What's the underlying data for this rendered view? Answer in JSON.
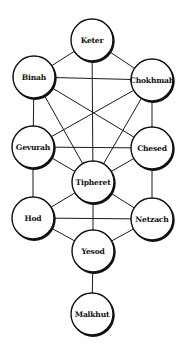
{
  "diagram": {
    "colors": {
      "background": "#ffffff",
      "line": "#1a1a1a",
      "node_fill": "#ffffff",
      "node_stroke": "#111111",
      "text": "#111111"
    },
    "node_radius": 21,
    "nodes": [
      {
        "id": "keter",
        "label": "Keter",
        "x": 92,
        "y": 40
      },
      {
        "id": "binah",
        "label": "Binah",
        "x": 34,
        "y": 77
      },
      {
        "id": "chokhmah",
        "label": "Chokhmah",
        "x": 152,
        "y": 80
      },
      {
        "id": "gevurah",
        "label": "Gevurah",
        "x": 33,
        "y": 147
      },
      {
        "id": "chesed",
        "label": "Chesed",
        "x": 152,
        "y": 148
      },
      {
        "id": "tipheret",
        "label": "Tipheret",
        "x": 93,
        "y": 182
      },
      {
        "id": "hod",
        "label": "Hod",
        "x": 33,
        "y": 218
      },
      {
        "id": "netzach",
        "label": "Netzach",
        "x": 152,
        "y": 219
      },
      {
        "id": "yesod",
        "label": "Yesod",
        "x": 93,
        "y": 251
      },
      {
        "id": "malkhut",
        "label": "Malkhut",
        "x": 92,
        "y": 314
      }
    ],
    "edges": [
      [
        "keter",
        "binah"
      ],
      [
        "keter",
        "chokhmah"
      ],
      [
        "keter",
        "tipheret"
      ],
      [
        "binah",
        "chokhmah"
      ],
      [
        "binah",
        "gevurah"
      ],
      [
        "binah",
        "tipheret"
      ],
      [
        "binah",
        "chesed"
      ],
      [
        "chokhmah",
        "chesed"
      ],
      [
        "chokhmah",
        "tipheret"
      ],
      [
        "chokhmah",
        "gevurah"
      ],
      [
        "gevurah",
        "chesed"
      ],
      [
        "gevurah",
        "tipheret"
      ],
      [
        "gevurah",
        "hod"
      ],
      [
        "chesed",
        "tipheret"
      ],
      [
        "chesed",
        "netzach"
      ],
      [
        "tipheret",
        "hod"
      ],
      [
        "tipheret",
        "netzach"
      ],
      [
        "tipheret",
        "yesod"
      ],
      [
        "hod",
        "netzach"
      ],
      [
        "hod",
        "yesod"
      ],
      [
        "netzach",
        "yesod"
      ],
      [
        "yesod",
        "malkhut"
      ]
    ]
  }
}
